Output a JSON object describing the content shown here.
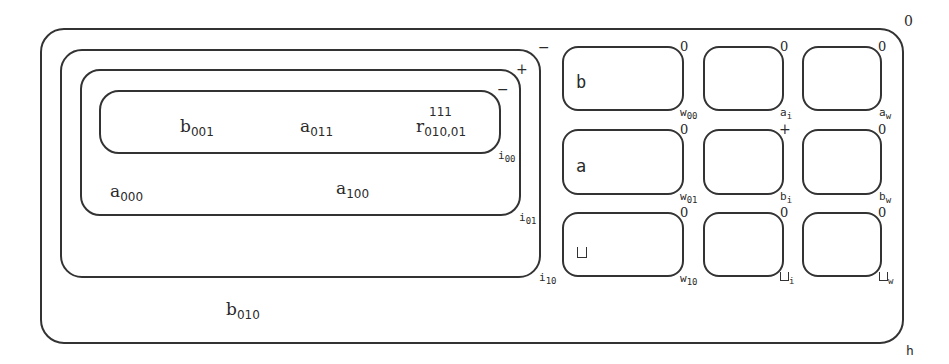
{
  "diagram": {
    "outer": {
      "label": "h",
      "corner_mark": "0"
    },
    "nested": [
      {
        "id": "i10",
        "label_base": "i",
        "label_sub": "10",
        "corner_mark": "−"
      },
      {
        "id": "i01",
        "label_base": "i",
        "label_sub": "01",
        "corner_mark": "+"
      },
      {
        "id": "i00",
        "label_base": "i",
        "label_sub": "00",
        "corner_mark": "−"
      }
    ],
    "inner_terms": [
      {
        "base": "b",
        "sub": "001"
      },
      {
        "base": "a",
        "sub": "011"
      }
    ],
    "r_term": {
      "base": "r",
      "sup": "111",
      "sub": "010,01"
    },
    "i01_terms": [
      {
        "base": "a",
        "sub": "000"
      },
      {
        "base": "a",
        "sub": "100"
      }
    ],
    "outer_term": {
      "base": "b",
      "sub": "010"
    },
    "grid": {
      "rows": [
        {
          "symbol": "b",
          "cells": [
            {
              "content": "b",
              "label_base": "w",
              "label_sub": "00",
              "corner_mark": "0"
            },
            {
              "content": "",
              "label_base": "a",
              "label_sub": "i",
              "corner_mark": "0"
            },
            {
              "content": "",
              "label_base": "a",
              "label_sub": "w",
              "corner_mark": "0"
            }
          ]
        },
        {
          "symbol": "a",
          "cells": [
            {
              "content": "a",
              "label_base": "w",
              "label_sub": "01",
              "corner_mark": "0"
            },
            {
              "content": "",
              "label_base": "b",
              "label_sub": "i",
              "corner_mark": "+"
            },
            {
              "content": "",
              "label_base": "b",
              "label_sub": "w",
              "corner_mark": "0"
            }
          ]
        },
        {
          "symbol": "blank",
          "cells": [
            {
              "content": "⊔",
              "label_base": "w",
              "label_sub": "10",
              "corner_mark": "0"
            },
            {
              "content": "",
              "label_base": "⊔",
              "label_sub": "i",
              "corner_mark": "0"
            },
            {
              "content": "",
              "label_base": "⊔",
              "label_sub": "w",
              "corner_mark": "0"
            }
          ]
        }
      ]
    }
  }
}
